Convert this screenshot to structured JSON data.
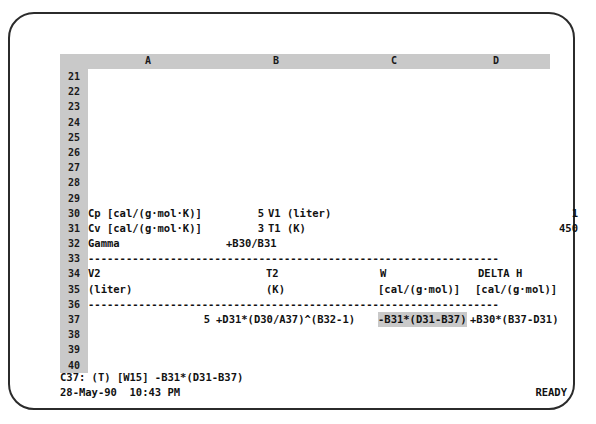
{
  "app": {
    "type": "spreadsheet",
    "style": "dos-text-mode"
  },
  "grid": {
    "columns": [
      {
        "label": "A"
      },
      {
        "label": "B"
      },
      {
        "label": "C"
      },
      {
        "label": "D"
      }
    ],
    "rows": [
      {
        "number": "21",
        "cells": []
      },
      {
        "number": "22",
        "cells": []
      },
      {
        "number": "23",
        "cells": []
      },
      {
        "number": "24",
        "cells": []
      },
      {
        "number": "25",
        "cells": []
      },
      {
        "number": "26",
        "cells": []
      },
      {
        "number": "27",
        "cells": []
      },
      {
        "number": "28",
        "cells": []
      },
      {
        "number": "29",
        "cells": []
      },
      {
        "number": "30",
        "cells": [
          {
            "text": "Cp [cal/(g·mol·K)]"
          },
          {
            "text": "5"
          },
          {
            "text": "V1 (liter)"
          },
          {
            "text": "1"
          }
        ]
      },
      {
        "number": "31",
        "cells": [
          {
            "text": "Cv [cal/(g·mol·K)]"
          },
          {
            "text": "3"
          },
          {
            "text": "T1 (K)"
          },
          {
            "text": "450"
          }
        ]
      },
      {
        "number": "32",
        "cells": [
          {
            "text": "Gamma"
          },
          {
            "text": "+B30/B31"
          }
        ]
      },
      {
        "number": "33",
        "separator": "-----------------------------------------------------------------"
      },
      {
        "number": "34",
        "cells": [
          {
            "text": "V2"
          },
          {
            "text": "T2"
          },
          {
            "text": "W"
          },
          {
            "text": "DELTA H"
          }
        ]
      },
      {
        "number": "35",
        "cells": [
          {
            "text": "(liter)"
          },
          {
            "text": "(K)"
          },
          {
            "text": "[cal/(g·mol)]"
          },
          {
            "text": "[cal/(g·mol)]"
          }
        ]
      },
      {
        "number": "36",
        "separator": "-----------------------------------------------------------------"
      },
      {
        "number": "37",
        "cells": [
          {
            "text": "5"
          },
          {
            "text": "+D31*(D30/A37)^(B32-1)"
          },
          {
            "text": "-B31*(D31-B37)"
          },
          {
            "text": "+B30*(B37-D31)"
          }
        ]
      },
      {
        "number": "38",
        "cells": []
      },
      {
        "number": "39",
        "cells": []
      },
      {
        "number": "40",
        "cells": []
      }
    ]
  },
  "selection": {
    "cell": "C37",
    "formula": "-B31*(D31-B37)"
  },
  "status": {
    "cell_reference_line": "C37: (T) [W15] -B31*(D31-B37)",
    "datetime": "28-May-90  10:43 PM",
    "mode": "READY"
  },
  "colors": {
    "header_gray": "#c9c9c9",
    "text": "#111111",
    "frame": "#2b2b2b"
  }
}
